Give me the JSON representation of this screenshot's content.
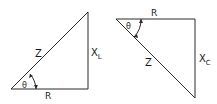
{
  "diagrams": [
    {
      "name": "inductive-impedance-triangle",
      "hypotenuse_label": "Z",
      "adjacent_label": "R",
      "opposite_label": "X",
      "opposite_subscript": "L",
      "angle_label": "θ"
    },
    {
      "name": "capacitive-impedance-triangle",
      "hypotenuse_label": "Z",
      "adjacent_label": "R",
      "opposite_label": "X",
      "opposite_subscript": "C",
      "angle_label": "θ"
    }
  ],
  "colors": {
    "line": "#2a2a2a",
    "text": "#1a1a1a",
    "background": "#ffffff"
  }
}
